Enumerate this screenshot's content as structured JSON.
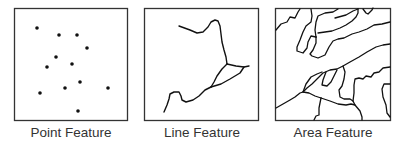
{
  "panels": [
    {
      "id": "point",
      "label": "Point Feature",
      "box": {
        "x": 14,
        "y": 8,
        "w": 114,
        "h": 113
      },
      "points": [
        [
          37,
          28
        ],
        [
          59,
          35
        ],
        [
          77,
          35
        ],
        [
          87,
          48
        ],
        [
          56,
          57
        ],
        [
          72,
          64
        ],
        [
          47,
          67
        ],
        [
          80,
          82
        ],
        [
          40,
          93
        ],
        [
          65,
          88
        ],
        [
          108,
          88
        ],
        [
          78,
          111
        ]
      ]
    },
    {
      "id": "line",
      "label": "Line Feature",
      "box": {
        "x": 144,
        "y": 8,
        "w": 115,
        "h": 113
      }
    },
    {
      "id": "area",
      "label": "Area Feature",
      "box": {
        "x": 275,
        "y": 8,
        "w": 116,
        "h": 113
      }
    }
  ],
  "colors": {
    "stroke": "#111111",
    "border": "#333333",
    "label": "#333333",
    "background": "#ffffff"
  }
}
